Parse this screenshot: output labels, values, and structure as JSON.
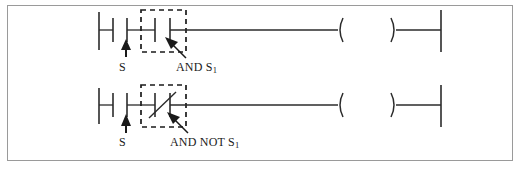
{
  "figure": {
    "kind": "ladder-logic-diagram",
    "title": "",
    "line_color": "#2b2b2b",
    "frame_color": "#9a9a9a",
    "background": "#ffffff",
    "highlight_style": "dashed-box"
  },
  "labels": {
    "s_top": "S",
    "s_bottom": "S",
    "and_s1_text": "AND S",
    "and_s1_sub": "1",
    "and_not_s1_text": "AND NOT S",
    "and_not_s1_sub": "1"
  },
  "rungs": [
    {
      "id": "rung-top",
      "y": 30,
      "elements": [
        {
          "type": "left-rail",
          "name": "left-power-rail"
        },
        {
          "type": "contact-no",
          "name": "contact-no-s",
          "label_ref": "s_top"
        },
        {
          "type": "contact-no",
          "name": "contact-no-s1",
          "highlighted": true,
          "label_ref": "and_s1_text"
        },
        {
          "type": "wire",
          "name": "rung-wire"
        },
        {
          "type": "coil",
          "name": "output-coil",
          "symbol": "( )"
        },
        {
          "type": "right-rail",
          "name": "right-power-rail"
        }
      ]
    },
    {
      "id": "rung-bottom",
      "y": 105,
      "elements": [
        {
          "type": "left-rail",
          "name": "left-power-rail"
        },
        {
          "type": "contact-no",
          "name": "contact-no-s",
          "label_ref": "s_bottom"
        },
        {
          "type": "contact-nc",
          "name": "contact-nc-s1",
          "highlighted": true,
          "label_ref": "and_not_s1_text"
        },
        {
          "type": "wire",
          "name": "rung-wire"
        },
        {
          "type": "coil",
          "name": "output-coil",
          "symbol": "( )"
        },
        {
          "type": "right-rail",
          "name": "right-power-rail"
        }
      ]
    }
  ],
  "annotations": [
    {
      "name": "arrow-up-to-contact-s-top",
      "direction": "up",
      "target": "contact-no-s"
    },
    {
      "name": "arrow-to-contact-s1-top",
      "direction": "up-left",
      "target": "contact-no-s1"
    },
    {
      "name": "arrow-up-to-contact-s-bottom",
      "direction": "up",
      "target": "contact-no-s"
    },
    {
      "name": "arrow-to-contact-s1-bottom",
      "direction": "up-left",
      "target": "contact-nc-s1"
    }
  ]
}
